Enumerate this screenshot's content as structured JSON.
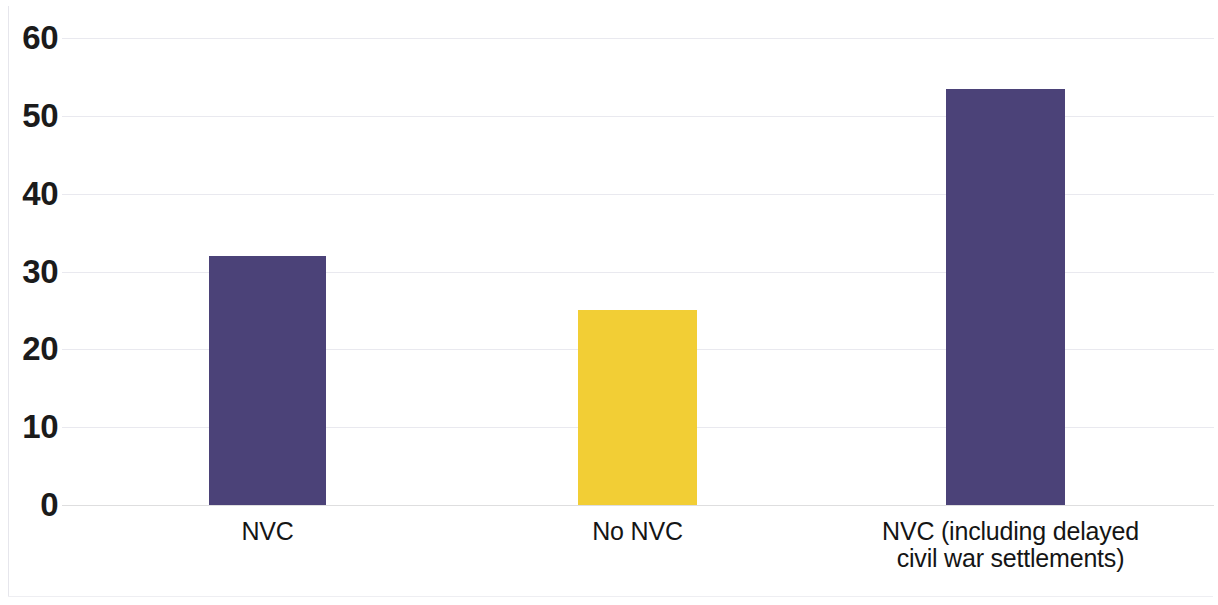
{
  "chart_data": {
    "type": "bar",
    "title": "",
    "subtitle": "",
    "xlabel": "",
    "ylabel": "",
    "categories": [
      "NVC",
      "No NVC",
      "NVC (including delayed\ncivil war settlements)"
    ],
    "values": [
      32,
      25,
      53.5
    ],
    "bar_colors": [
      "#4b4278",
      "#f2ce35",
      "#4b4278"
    ],
    "ylim": [
      0,
      60
    ],
    "yticks": [
      0,
      10,
      20,
      30,
      40,
      50,
      60
    ],
    "ytick_labels": [
      "0",
      "10",
      "20",
      "30",
      "40",
      "50",
      "60"
    ],
    "grid": true,
    "grid_axis": "y",
    "grid_color": "#e9e9ef",
    "legend": false,
    "legend_position": "none",
    "annotations": [],
    "series": [
      {
        "name": "",
        "values": [
          32,
          25,
          53.5
        ]
      }
    ]
  },
  "axis": {
    "y_ticks": [
      {
        "label": "60",
        "value": 60
      },
      {
        "label": "50",
        "value": 50
      },
      {
        "label": "40",
        "value": 40
      },
      {
        "label": "30",
        "value": 30
      },
      {
        "label": "20",
        "value": 20
      },
      {
        "label": "10",
        "value": 10
      },
      {
        "label": "0",
        "value": 0
      }
    ]
  },
  "bars": [
    {
      "label": "NVC",
      "value": 32,
      "color": "#4b4278"
    },
    {
      "label": "No NVC",
      "value": 25,
      "color": "#f2ce35"
    },
    {
      "label": "NVC (including delayed\ncivil war settlements)",
      "value": 53.5,
      "color": "#4b4278"
    }
  ]
}
